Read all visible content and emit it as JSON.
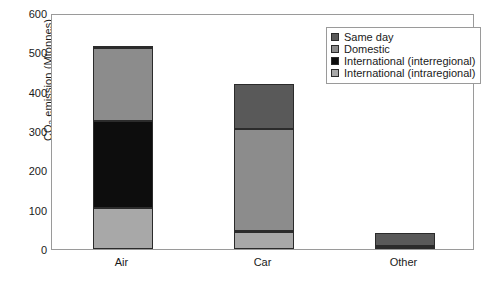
{
  "chart_data": {
    "type": "bar",
    "stacked": true,
    "title": "",
    "subtitle": "",
    "xlabel": "",
    "ylabel": "CO2 emission (Mtonnes)",
    "ylabel_parts": {
      "prefix": "CO",
      "sub": "2",
      "suffix": " emission (Mtonnes)"
    },
    "categories": [
      "Air",
      "Car",
      "Other"
    ],
    "ylim": [
      0,
      600
    ],
    "ytick_labels": [
      "0",
      "100",
      "200",
      "300",
      "400",
      "500",
      "600"
    ],
    "ytick_values": [
      0,
      100,
      200,
      300,
      400,
      500,
      600
    ],
    "grid": false,
    "legend_position": "top-right",
    "series": [
      {
        "name": "International (intraregional)",
        "color": "#a8a8a8",
        "values": [
          105,
          42,
          3
        ]
      },
      {
        "name": "International (interregional)",
        "color": "#0d0d0d",
        "values": [
          220,
          3,
          2
        ]
      },
      {
        "name": "Domestic",
        "color": "#8c8c8c",
        "values": [
          185,
          260,
          3
        ]
      },
      {
        "name": "Same day",
        "color": "#595959",
        "values": [
          7,
          115,
          34
        ]
      }
    ],
    "stack_order_bottom_to_top": [
      "International (intraregional)",
      "International (interregional)",
      "Domestic",
      "Same day"
    ],
    "totals": [
      517,
      420,
      42
    ],
    "segment_boundaries": {
      "Air": [
        0,
        105,
        325,
        510,
        517
      ],
      "Car": [
        0,
        42,
        45,
        305,
        420
      ],
      "Other": [
        0,
        3,
        5,
        8,
        42
      ]
    }
  },
  "legend": {
    "items": [
      {
        "label": "Same day",
        "color": "#595959"
      },
      {
        "label": "Domestic",
        "color": "#8c8c8c"
      },
      {
        "label": "International (interregional)",
        "color": "#0d0d0d"
      },
      {
        "label": "International (intraregional)",
        "color": "#a8a8a8"
      }
    ]
  },
  "colors": {
    "axis": "#9a9a9a",
    "text": "#1a1a1a",
    "background": "#ffffff",
    "bar_outline": "#2b2b2b"
  }
}
